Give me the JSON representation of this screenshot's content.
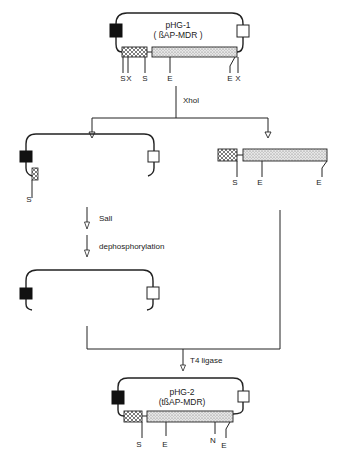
{
  "diagram": {
    "type": "cloning-scheme",
    "colors": {
      "ink": "#222222",
      "background": "#ffffff",
      "marker_black": "#111111",
      "marker_white": "#ffffff"
    },
    "plasmid_top": {
      "name": "pHG-1",
      "insert": "( ßAP-MDR )",
      "sites": [
        "S",
        "X",
        "S",
        "E",
        "E",
        "X"
      ]
    },
    "step_xhoi": {
      "enzyme": "XhoI",
      "label": "Xhol"
    },
    "vector_fragment": {
      "sites": [
        "S"
      ]
    },
    "insert_fragment": {
      "sites": [
        "S",
        "E",
        "E"
      ]
    },
    "step_sali": {
      "label": "SalI",
      "display": "Sall"
    },
    "step_dephos": {
      "label": "dephosphorylation"
    },
    "step_ligation": {
      "label": "T4  ligase"
    },
    "plasmid_bottom": {
      "name": "pHG-2",
      "insert": "(tßAP-MDR)",
      "sites": [
        "S",
        "E",
        "N",
        "E"
      ]
    }
  }
}
